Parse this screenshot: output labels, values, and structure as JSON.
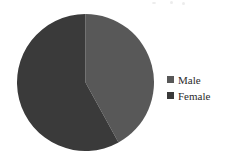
{
  "chart_data": {
    "type": "pie",
    "title": "",
    "subtitle": "",
    "xlabel": "",
    "ylabel": "",
    "grid": false,
    "legend_position": "right",
    "categories": [
      "Male",
      "Female"
    ],
    "values": [
      42,
      58
    ],
    "units": "percent",
    "start_angle_deg": 0,
    "direction": "clockwise",
    "series": [
      {
        "name": "Gender",
        "values": [
          42,
          58
        ]
      }
    ],
    "slices": [
      {
        "label": "Male",
        "value": 42,
        "color": "#585858",
        "start_angle_deg": 0,
        "end_angle_deg": 151
      },
      {
        "label": "Female",
        "value": 58,
        "color": "#3a3a3a",
        "start_angle_deg": 151,
        "end_angle_deg": 360
      }
    ],
    "colors": [
      "#585858",
      "#3a3a3a"
    ],
    "background_color": "#ffffff"
  },
  "legend": {
    "items": [
      {
        "label": "Male",
        "color": "#585858"
      },
      {
        "label": "Female",
        "color": "#3a3a3a"
      }
    ]
  }
}
